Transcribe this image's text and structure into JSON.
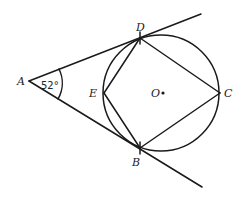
{
  "diagram": {
    "type": "geometry",
    "angle_label": "52°",
    "points": {
      "A": {
        "label": "A",
        "x": 29,
        "y": 81
      },
      "D": {
        "label": "D",
        "x": 140,
        "y": 38
      },
      "B": {
        "label": "B",
        "x": 140,
        "y": 148
      },
      "C": {
        "label": "C",
        "x": 220,
        "y": 93
      },
      "E": {
        "label": "E",
        "x": 104,
        "y": 93
      },
      "O": {
        "label": "O",
        "x": 161,
        "y": 93
      }
    },
    "circle": {
      "center": "O",
      "radius": 58
    },
    "segments": [
      [
        "A",
        "D-extended"
      ],
      [
        "A",
        "B-extended"
      ],
      [
        "E",
        "D"
      ],
      [
        "D",
        "C"
      ],
      [
        "C",
        "B"
      ],
      [
        "B",
        "E"
      ]
    ],
    "colors": {
      "stroke": "#1a1a1a",
      "background": "#ffffff"
    }
  }
}
